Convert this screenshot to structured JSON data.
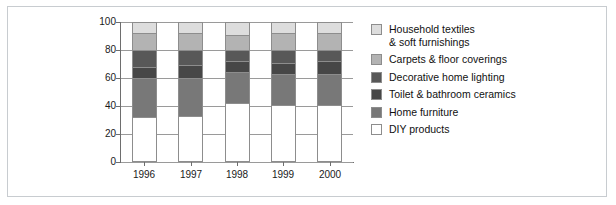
{
  "figure": {
    "background": "#ffffff",
    "frame_color": "#c8ccd0",
    "caption_sliver": " "
  },
  "chart_data": {
    "type": "bar",
    "stacked": true,
    "title": "",
    "subtitle": "",
    "xlabel": "",
    "ylabel": "",
    "categories": [
      "1996",
      "1997",
      "1998",
      "1999",
      "2000"
    ],
    "ylim": [
      0,
      100
    ],
    "yticks": [
      0,
      20,
      40,
      60,
      80,
      100
    ],
    "ytick_labels": [
      "0",
      "20",
      "40",
      "60",
      "80",
      "100"
    ],
    "grid": true,
    "grid_axis": "y",
    "legend_position": "right",
    "series": [
      {
        "name": "DIY products",
        "color": "#ffffff",
        "values": [
          32,
          33,
          42,
          41,
          41
        ]
      },
      {
        "name": "Home furniture",
        "color": "#787878",
        "values": [
          28,
          27,
          22,
          22,
          22
        ]
      },
      {
        "name": "Toilet & bathroom ceramics",
        "color": "#474747",
        "values": [
          8,
          9,
          8,
          8,
          9
        ]
      },
      {
        "name": "Decorative home lighting",
        "color": "#585858",
        "values": [
          12,
          11,
          8,
          9,
          8
        ]
      },
      {
        "name": "Carpets & floor coverings",
        "color": "#b3b3b3",
        "values": [
          12,
          12,
          11,
          12,
          12
        ]
      },
      {
        "name": "Household textiles & soft furnishings",
        "color": "#dddddd",
        "values": [
          8,
          8,
          9,
          8,
          8
        ]
      }
    ],
    "stack_order_top_to_bottom": [
      "Household textiles & soft furnishings",
      "Carpets & floor coverings",
      "Decorative home lighting",
      "Toilet & bathroom ceramics",
      "Home furniture",
      "DIY products"
    ]
  },
  "legend": {
    "items": [
      {
        "label": "Household textiles\n& soft furnishings",
        "color": "#dddddd"
      },
      {
        "label": "Carpets & floor coverings",
        "color": "#b3b3b3"
      },
      {
        "label": "Decorative home lighting",
        "color": "#585858"
      },
      {
        "label": "Toilet & bathroom ceramics",
        "color": "#474747"
      },
      {
        "label": "Home furniture",
        "color": "#787878"
      },
      {
        "label": "DIY products",
        "color": "#ffffff"
      }
    ]
  },
  "axes": {
    "ytick_labels": [
      "100",
      "80",
      "60",
      "40",
      "20",
      "0"
    ],
    "xtick_labels": [
      "1996",
      "1997",
      "1998",
      "1999",
      "2000"
    ]
  }
}
